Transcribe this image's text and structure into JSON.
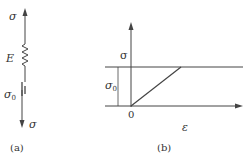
{
  "figure": {
    "colors": {
      "ink": "#444444",
      "background": "#ffffff"
    },
    "panel_a": {
      "caption": "(a)",
      "top_stress_label": "σ",
      "bottom_stress_label": "σ",
      "spring_label": "E",
      "friction_label": "σ",
      "friction_label_sub": "0",
      "elements": [
        "arrow-up",
        "spring",
        "friction-element",
        "arrow-down"
      ]
    },
    "panel_b": {
      "caption": "(b)",
      "y_axis_label": "σ",
      "x_axis_label": "ε",
      "origin_label": "0",
      "yield_label": "σ",
      "yield_label_sub": "0",
      "curve": "linear rise from origin to yield stress σ0, then horizontal plateau"
    }
  }
}
